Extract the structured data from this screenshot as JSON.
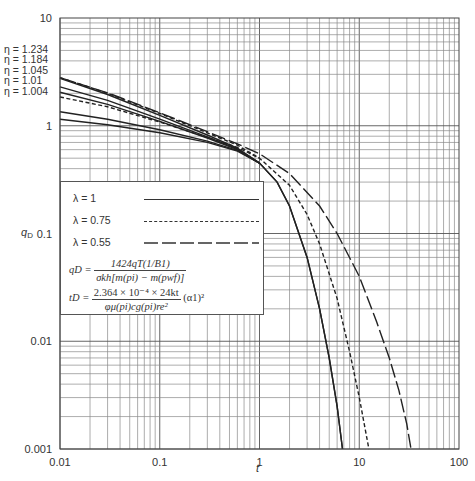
{
  "chart_data": {
    "type": "line",
    "title": "",
    "xlabel": "t",
    "ylabel": "qD",
    "xscale": "log",
    "yscale": "log",
    "xlim": [
      0.01,
      100
    ],
    "ylim": [
      0.001,
      10
    ],
    "grid": true,
    "x_ticks": [
      "0.01",
      "0.1",
      "1",
      "10",
      "100"
    ],
    "y_ticks": [
      "10",
      "1",
      "0.1",
      "0.01",
      "0.001"
    ],
    "eta_labels": [
      "η = 1.234",
      "η = 1.184",
      "η = 1.045",
      "η = 1.01",
      "η = 1.004"
    ],
    "legend": [
      {
        "label": "λ = 1",
        "style": "solid"
      },
      {
        "label": "λ = 0.75",
        "style": "dashed"
      },
      {
        "label": "λ = 0.55",
        "style": "longdash"
      }
    ],
    "formulas": {
      "qd_lhs": "qD =",
      "qd_num": "1424qT(1/B1)",
      "qd_den": "σkh[m(pi) − m(pwf)]",
      "td_lhs": "tD =",
      "td_num": "2.364 × 10⁻⁴ × 24kt",
      "td_den": "φμ(pi)cg(pi)re²",
      "td_tail": "(α1)²"
    },
    "series": [
      {
        "name": "λ=1, η=1.234",
        "style": "solid",
        "t": [
          0.01,
          0.03,
          0.1,
          0.3,
          0.6,
          1,
          1.5,
          2,
          3,
          4,
          5,
          6,
          6.8
        ],
        "q": [
          2.75,
          1.95,
          1.25,
          0.82,
          0.62,
          0.45,
          0.3,
          0.18,
          0.06,
          0.02,
          0.007,
          0.0025,
          0.001
        ]
      },
      {
        "name": "λ=1, η=1.184",
        "style": "solid",
        "t": [
          0.01,
          0.03,
          0.1,
          0.3,
          0.6,
          1,
          1.5,
          2,
          3,
          4,
          5,
          6,
          6.8
        ],
        "q": [
          2.3,
          1.72,
          1.15,
          0.79,
          0.61,
          0.45,
          0.3,
          0.18,
          0.06,
          0.02,
          0.007,
          0.0025,
          0.001
        ]
      },
      {
        "name": "λ=1, η=1.045",
        "style": "solid",
        "t": [
          0.01,
          0.03,
          0.1,
          0.3,
          0.6,
          1
        ],
        "q": [
          2.05,
          1.58,
          1.1,
          0.77,
          0.6,
          0.45
        ]
      },
      {
        "name": "λ=1, η=1.01",
        "style": "solid",
        "t": [
          0.01,
          0.03,
          0.1,
          0.3,
          0.6,
          1
        ],
        "q": [
          1.35,
          1.15,
          0.92,
          0.72,
          0.59,
          0.45
        ]
      },
      {
        "name": "λ=1, η=1.004",
        "style": "solid",
        "t": [
          0.01,
          0.03,
          0.1,
          0.3,
          0.6,
          1
        ],
        "q": [
          1.15,
          1.02,
          0.86,
          0.7,
          0.58,
          0.45
        ]
      },
      {
        "name": "λ=0.75, η=1.234",
        "style": "dashed",
        "t": [
          0.01,
          0.03,
          0.1,
          0.3,
          0.6,
          1,
          2,
          3,
          4,
          6,
          8,
          10,
          12.5
        ],
        "q": [
          2.8,
          2.0,
          1.3,
          0.86,
          0.66,
          0.5,
          0.28,
          0.15,
          0.08,
          0.025,
          0.008,
          0.003,
          0.001
        ]
      },
      {
        "name": "λ=0.75, η=1.045",
        "style": "dashed",
        "t": [
          0.01,
          0.03,
          0.1,
          0.3,
          0.6,
          1
        ],
        "q": [
          1.85,
          1.5,
          1.08,
          0.78,
          0.63,
          0.5
        ]
      },
      {
        "name": "λ=0.55, η=1.234",
        "style": "longdash",
        "t": [
          0.01,
          0.03,
          0.1,
          0.3,
          0.6,
          1,
          2,
          4,
          6,
          10,
          15,
          20,
          25,
          30,
          33
        ],
        "q": [
          2.8,
          2.02,
          1.32,
          0.88,
          0.68,
          0.55,
          0.36,
          0.18,
          0.1,
          0.04,
          0.015,
          0.007,
          0.0035,
          0.0017,
          0.001
        ]
      }
    ]
  }
}
